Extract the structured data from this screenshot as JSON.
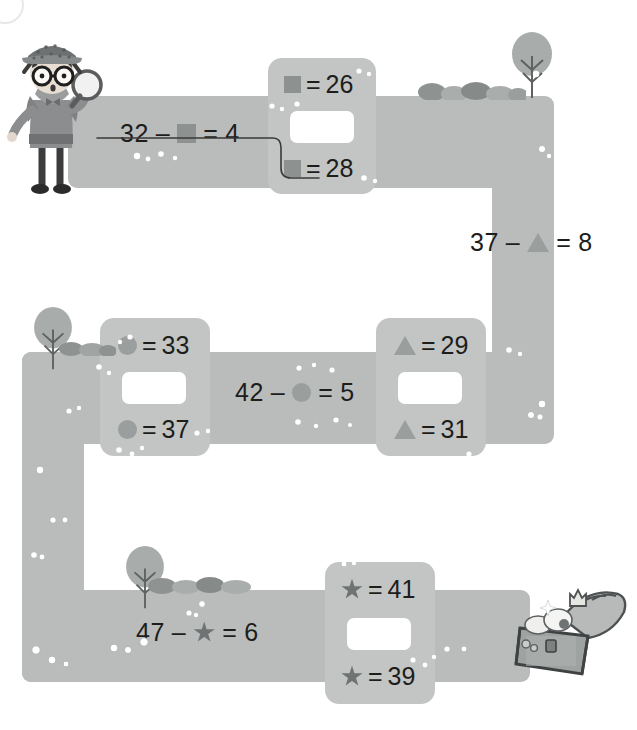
{
  "worksheet": {
    "title": "Subtraction maze with shape unknowns",
    "corner_marker": "page-corner-circle",
    "start_character": "detective-with-magnifying-glass",
    "end_character": "treasure-chest"
  },
  "colors": {
    "road": "#b9bcbb",
    "pad": "#c2c5c4",
    "answer_box": "#ffffff",
    "text": "#1d1d1b",
    "square_shape": "#8d9190",
    "circle_shape": "#9a9e9d",
    "triangle_shape": "#9a9e9d",
    "star_shape": "#6f7373",
    "tree_foliage": "#a8acab",
    "tree_trunk": "#5e6261",
    "rock": "#9fa3a2"
  },
  "equations": [
    {
      "id": "equation-square",
      "left": "32",
      "minus": "–",
      "shape": "square",
      "equals": "=",
      "right": "4",
      "solved": true,
      "answer": 28
    },
    {
      "id": "equation-triangle",
      "left": "37",
      "minus": "–",
      "shape": "triangle",
      "equals": "=",
      "right": "8",
      "solved": false,
      "answer": 29
    },
    {
      "id": "equation-circle",
      "left": "42",
      "minus": "–",
      "shape": "circle",
      "equals": "=",
      "right": "5",
      "solved": false,
      "answer": 37
    },
    {
      "id": "equation-star",
      "left": "47",
      "minus": "–",
      "shape": "star",
      "equals": "=",
      "right": "6",
      "solved": false,
      "answer": 41
    }
  ],
  "choice_pads": [
    {
      "id": "choice-pad-square",
      "shape": "square",
      "top_equals": "=",
      "top_value": "26",
      "bottom_equals": "=",
      "bottom_value": "28",
      "answer_box_value": ""
    },
    {
      "id": "choice-pad-circle",
      "shape": "circle",
      "top_equals": "=",
      "top_value": "33",
      "bottom_equals": "=",
      "bottom_value": "37",
      "answer_box_value": ""
    },
    {
      "id": "choice-pad-triangle",
      "shape": "triangle",
      "top_equals": "=",
      "top_value": "29",
      "bottom_equals": "=",
      "bottom_value": "31",
      "answer_box_value": ""
    },
    {
      "id": "choice-pad-star",
      "shape": "star",
      "top_equals": "=",
      "top_value": "41",
      "bottom_equals": "=",
      "bottom_value": "39",
      "answer_box_value": ""
    }
  ],
  "drawn_answer": {
    "description": "pencil line from square equation to the = 28 choice",
    "from_equation": "equation-square",
    "to_choice": "28"
  }
}
